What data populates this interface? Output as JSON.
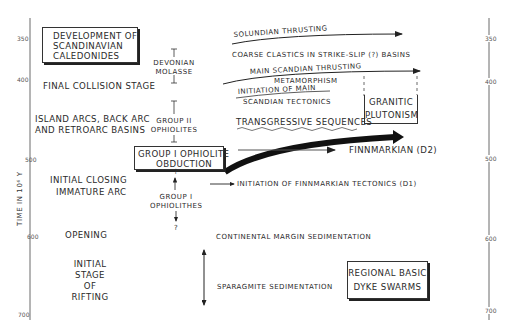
{
  "axes": {
    "ylabel": "TIME IN 10⁶ Y",
    "ticks": [
      "350",
      "400",
      "500",
      "600",
      "700"
    ]
  },
  "boxes": {
    "title": [
      "DEVELOPMENT OF",
      "SCANDINAVIAN",
      "CALEDONIDES"
    ],
    "obduction": [
      "GROUP I OPHIOLITE",
      "OBDUCTION"
    ],
    "granitic": [
      "GRANITIC",
      "PLUTONISM"
    ],
    "dyke": [
      "REGIONAL BASIC",
      "DYKE SWARMS"
    ]
  },
  "stages": {
    "final_collision": "FINAL COLLISION STAGE",
    "island_arcs": [
      "ISLAND ARCS, BACK ARC",
      "AND RETROARC BASINS"
    ],
    "initial_closing": [
      "INITIAL CLOSING",
      "IMMATURE ARC"
    ],
    "opening": "OPENING",
    "rifting": [
      "INITIAL",
      "STAGE",
      "OF",
      "RIFTING"
    ]
  },
  "middle": {
    "devonian": [
      "DEVONIAN",
      "MOLASSE"
    ],
    "group2": [
      "GROUP II",
      "OPHIOLITES"
    ],
    "group1": [
      "GROUP I",
      "OPHIOLITHES"
    ],
    "question": "?"
  },
  "events": {
    "solundian": "SOLUNDIAN THRUSTING",
    "coarse": "COARSE CLASTICS IN STRIKE-SLIP (?) BASINS",
    "main_thrusting": "MAIN SCANDIAN THRUSTING",
    "metamorphism": "METAMORPHISM",
    "initiation_main": "INITIATION OF MAIN",
    "scandian_tect": "SCANDIAN TECTONICS",
    "transgressive": "TRANSGRESSIVE SEQUENCES",
    "finnmarkian_d2": "FINNMARKIAN (D2)",
    "finnmarkian_d1": "INITIATION OF FINNMARKIAN TECTONICS (D1)",
    "continental": "CONTINENTAL MARGIN SEDIMENTATION",
    "sparagmite": "SPARAGMITE SEDIMENTATION"
  }
}
